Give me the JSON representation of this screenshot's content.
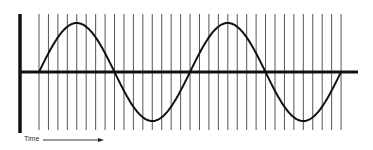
{
  "diagram": {
    "x_axis_label": "Time",
    "x_axis_arrow": "arrow-right",
    "colors": {
      "lines": "#1a1a1a",
      "sample_lines": "#555555",
      "background": "#ffffff"
    },
    "sampling": {
      "first_x": 39,
      "spacing": 9.44,
      "count": 33,
      "top_y": 14,
      "bottom_y": 130
    },
    "wave": {
      "start_x": 39,
      "period_px": 151,
      "cycles": 2,
      "baseline_y": 72,
      "amplitude_px": 49
    }
  }
}
